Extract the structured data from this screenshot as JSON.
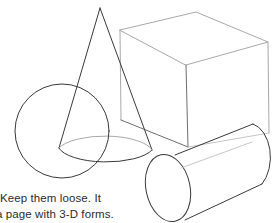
{
  "page": {
    "background_color": "#ffffff",
    "width": 273,
    "height": 223,
    "kind": "instructional-drawing-figure"
  },
  "figure": {
    "stroke_colors": {
      "dark": "#3a3a3c",
      "mid": "#6e6e73",
      "light": "#a9a9ad",
      "faint": "#c6c6ca"
    },
    "shapes": [
      {
        "name": "sphere",
        "label": "Sphere",
        "geometry": "circle",
        "center_x": 62,
        "center_y": 131,
        "radius": 47
      },
      {
        "name": "cone",
        "label": "Cone",
        "geometry": "cone",
        "apex_x": 100,
        "apex_y": 8,
        "base_center_x": 105,
        "base_center_y": 146,
        "base_rx": 50,
        "base_ry": 17
      },
      {
        "name": "cube",
        "label": "Cube",
        "geometry": "box-in-perspective",
        "front_left_x": 120,
        "front_top_y": 30,
        "far_right_x": 268,
        "far_right_y": 42
      },
      {
        "name": "cylinder",
        "label": "Cylinder",
        "geometry": "cylinder-tilted",
        "near_cap_center_x": 168,
        "near_cap_center_y": 188,
        "near_cap_rx": 22,
        "near_cap_ry": 34,
        "axis_angle_degrees": -33
      }
    ]
  },
  "caption": {
    "lines": [
      "Keep them loose. It",
      "a page with 3-D forms."
    ],
    "line1": "Keep them loose. It",
    "line2": "a page with 3-D forms.",
    "text_color": "#2c2c2e",
    "note": "Caption text is cropped at the left edge of the image"
  }
}
